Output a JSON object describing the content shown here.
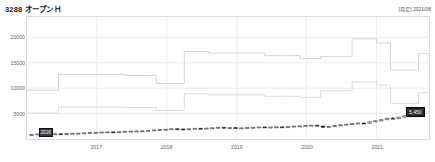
{
  "header": {
    "title": "3288 オープンＨ",
    "meta": "[月足] 2021/08"
  },
  "axes": {
    "y_ticks": [
      "20000",
      "15000",
      "10000",
      "5000"
    ],
    "x_ticks": [
      "2017",
      "2018",
      "2019",
      "2020",
      "2021"
    ]
  },
  "tags": {
    "last_price": "5,450",
    "cursor_date": "2016"
  },
  "colors": {
    "grid": "#ececec",
    "frame": "#dcdcdc",
    "line_upper": "#cfcfcf",
    "line_lower": "#d6d6d6",
    "candle_up": "#ffffff",
    "candle_down": "#1a1a1a",
    "candle_edge": "#222222",
    "tag_bg": "#2b2b2b",
    "text": "#333333"
  },
  "chart_data": {
    "type": "line",
    "title": "3288 オープンＨ",
    "subtitle": "[月足] 2021/08",
    "xlabel": "",
    "ylabel": "",
    "ylim": [
      0,
      24000
    ],
    "xlim": [
      2016.0,
      2021.75
    ],
    "grid": true,
    "legend": "none",
    "y_tick_values": [
      20000,
      15000,
      10000,
      5000
    ],
    "x_tick_values": [
      2017,
      2018,
      2019,
      2020,
      2021
    ],
    "series": [
      {
        "name": "upper-step-line",
        "type": "step",
        "color": "#cfcfcf",
        "x": [
          2016.0,
          2016.3,
          2016.45,
          2016.6,
          2017.0,
          2017.4,
          2017.7,
          2017.85,
          2018.0,
          2018.25,
          2018.45,
          2018.6,
          2019.0,
          2019.4,
          2019.7,
          2019.9,
          2020.0,
          2020.2,
          2020.45,
          2020.65,
          2020.85,
          2021.0,
          2021.2,
          2021.4,
          2021.6,
          2021.75
        ],
        "values": [
          9600,
          9600,
          12700,
          12700,
          12700,
          12500,
          12500,
          10900,
          10900,
          17200,
          17200,
          16900,
          16900,
          16400,
          16400,
          15800,
          15800,
          16200,
          16200,
          19700,
          19700,
          18900,
          13600,
          13600,
          16800,
          16100
        ]
      },
      {
        "name": "lower-step-line",
        "type": "step",
        "color": "#d6d6d6",
        "x": [
          2016.0,
          2016.3,
          2016.45,
          2016.6,
          2017.0,
          2017.4,
          2017.7,
          2017.85,
          2018.0,
          2018.25,
          2018.45,
          2018.6,
          2019.0,
          2019.4,
          2019.7,
          2019.9,
          2020.0,
          2020.2,
          2020.45,
          2020.65,
          2020.85,
          2021.0,
          2021.2,
          2021.4,
          2021.6,
          2021.75
        ],
        "values": [
          5100,
          5100,
          6300,
          6300,
          6300,
          6200,
          6200,
          5600,
          5600,
          8900,
          8900,
          8700,
          8700,
          8400,
          8400,
          8200,
          8200,
          9500,
          9500,
          11200,
          11200,
          10600,
          7000,
          7000,
          9100,
          8900
        ]
      },
      {
        "name": "candlestick-monthly",
        "type": "candlestick",
        "up_color": "#ffffff",
        "down_color": "#1a1a1a",
        "ohlc": [
          {
            "t": "2016-01",
            "o": 820,
            "h": 900,
            "l": 760,
            "c": 860
          },
          {
            "t": "2016-02",
            "o": 860,
            "h": 1010,
            "l": 830,
            "c": 980
          },
          {
            "t": "2016-03",
            "o": 980,
            "h": 1040,
            "l": 900,
            "c": 930
          },
          {
            "t": "2016-04",
            "o": 930,
            "h": 1000,
            "l": 890,
            "c": 960
          },
          {
            "t": "2016-05",
            "o": 960,
            "h": 1060,
            "l": 930,
            "c": 1030
          },
          {
            "t": "2016-06",
            "o": 1030,
            "h": 1080,
            "l": 950,
            "c": 990
          },
          {
            "t": "2016-07",
            "o": 990,
            "h": 1090,
            "l": 960,
            "c": 1060
          },
          {
            "t": "2016-08",
            "o": 1060,
            "h": 1140,
            "l": 1020,
            "c": 1110
          },
          {
            "t": "2016-09",
            "o": 1110,
            "h": 1180,
            "l": 1060,
            "c": 1130
          },
          {
            "t": "2016-10",
            "o": 1130,
            "h": 1230,
            "l": 1100,
            "c": 1200
          },
          {
            "t": "2016-11",
            "o": 1200,
            "h": 1290,
            "l": 1160,
            "c": 1260
          },
          {
            "t": "2016-12",
            "o": 1260,
            "h": 1340,
            "l": 1220,
            "c": 1300
          },
          {
            "t": "2017-01",
            "o": 1300,
            "h": 1390,
            "l": 1270,
            "c": 1360
          },
          {
            "t": "2017-02",
            "o": 1360,
            "h": 1430,
            "l": 1320,
            "c": 1400
          },
          {
            "t": "2017-03",
            "o": 1400,
            "h": 1470,
            "l": 1350,
            "c": 1380
          },
          {
            "t": "2017-04",
            "o": 1380,
            "h": 1460,
            "l": 1340,
            "c": 1430
          },
          {
            "t": "2017-05",
            "o": 1430,
            "h": 1520,
            "l": 1400,
            "c": 1490
          },
          {
            "t": "2017-06",
            "o": 1490,
            "h": 1580,
            "l": 1450,
            "c": 1540
          },
          {
            "t": "2017-07",
            "o": 1540,
            "h": 1620,
            "l": 1500,
            "c": 1580
          },
          {
            "t": "2017-08",
            "o": 1580,
            "h": 1660,
            "l": 1530,
            "c": 1610
          },
          {
            "t": "2017-09",
            "o": 1610,
            "h": 1720,
            "l": 1580,
            "c": 1690
          },
          {
            "t": "2017-10",
            "o": 1690,
            "h": 1810,
            "l": 1660,
            "c": 1780
          },
          {
            "t": "2017-11",
            "o": 1780,
            "h": 1900,
            "l": 1740,
            "c": 1860
          },
          {
            "t": "2017-12",
            "o": 1860,
            "h": 1960,
            "l": 1800,
            "c": 1900
          },
          {
            "t": "2018-01",
            "o": 1900,
            "h": 2050,
            "l": 1870,
            "c": 2010
          },
          {
            "t": "2018-02",
            "o": 2010,
            "h": 2090,
            "l": 1930,
            "c": 1970
          },
          {
            "t": "2018-03",
            "o": 1970,
            "h": 2060,
            "l": 1900,
            "c": 1930
          },
          {
            "t": "2018-04",
            "o": 1930,
            "h": 2040,
            "l": 1890,
            "c": 2000
          },
          {
            "t": "2018-05",
            "o": 2000,
            "h": 2130,
            "l": 1960,
            "c": 2090
          },
          {
            "t": "2018-06",
            "o": 2090,
            "h": 2180,
            "l": 2030,
            "c": 2060
          },
          {
            "t": "2018-07",
            "o": 2060,
            "h": 2170,
            "l": 2010,
            "c": 2130
          },
          {
            "t": "2018-08",
            "o": 2130,
            "h": 2240,
            "l": 2090,
            "c": 2200
          },
          {
            "t": "2018-09",
            "o": 2200,
            "h": 2330,
            "l": 2160,
            "c": 2290
          },
          {
            "t": "2018-10",
            "o": 2290,
            "h": 2360,
            "l": 2120,
            "c": 2180
          },
          {
            "t": "2018-11",
            "o": 2180,
            "h": 2280,
            "l": 2130,
            "c": 2240
          },
          {
            "t": "2018-12",
            "o": 2240,
            "h": 2310,
            "l": 2060,
            "c": 2110
          },
          {
            "t": "2019-01",
            "o": 2110,
            "h": 2230,
            "l": 2070,
            "c": 2190
          },
          {
            "t": "2019-02",
            "o": 2190,
            "h": 2290,
            "l": 2150,
            "c": 2250
          },
          {
            "t": "2019-03",
            "o": 2250,
            "h": 2340,
            "l": 2190,
            "c": 2280
          },
          {
            "t": "2019-04",
            "o": 2280,
            "h": 2400,
            "l": 2240,
            "c": 2360
          },
          {
            "t": "2019-05",
            "o": 2360,
            "h": 2420,
            "l": 2210,
            "c": 2260
          },
          {
            "t": "2019-06",
            "o": 2260,
            "h": 2370,
            "l": 2220,
            "c": 2330
          },
          {
            "t": "2019-07",
            "o": 2330,
            "h": 2430,
            "l": 2290,
            "c": 2390
          },
          {
            "t": "2019-08",
            "o": 2390,
            "h": 2450,
            "l": 2280,
            "c": 2320
          },
          {
            "t": "2019-09",
            "o": 2320,
            "h": 2470,
            "l": 2290,
            "c": 2430
          },
          {
            "t": "2019-10",
            "o": 2430,
            "h": 2560,
            "l": 2390,
            "c": 2520
          },
          {
            "t": "2019-11",
            "o": 2520,
            "h": 2620,
            "l": 2470,
            "c": 2580
          },
          {
            "t": "2019-12",
            "o": 2580,
            "h": 2700,
            "l": 2540,
            "c": 2660
          },
          {
            "t": "2020-01",
            "o": 2660,
            "h": 2760,
            "l": 2600,
            "c": 2700
          },
          {
            "t": "2020-02",
            "o": 2700,
            "h": 2780,
            "l": 2480,
            "c": 2540
          },
          {
            "t": "2020-03",
            "o": 2540,
            "h": 2620,
            "l": 2200,
            "c": 2300
          },
          {
            "t": "2020-04",
            "o": 2300,
            "h": 2520,
            "l": 2260,
            "c": 2470
          },
          {
            "t": "2020-05",
            "o": 2470,
            "h": 2680,
            "l": 2430,
            "c": 2640
          },
          {
            "t": "2020-06",
            "o": 2640,
            "h": 2830,
            "l": 2590,
            "c": 2780
          },
          {
            "t": "2020-07",
            "o": 2780,
            "h": 2950,
            "l": 2730,
            "c": 2900
          },
          {
            "t": "2020-08",
            "o": 2900,
            "h": 3080,
            "l": 2850,
            "c": 3030
          },
          {
            "t": "2020-09",
            "o": 3030,
            "h": 3200,
            "l": 2960,
            "c": 3130
          },
          {
            "t": "2020-10",
            "o": 3130,
            "h": 3280,
            "l": 3040,
            "c": 3100
          },
          {
            "t": "2020-11",
            "o": 3100,
            "h": 3420,
            "l": 3060,
            "c": 3380
          },
          {
            "t": "2020-12",
            "o": 3380,
            "h": 3620,
            "l": 3330,
            "c": 3570
          },
          {
            "t": "2021-01",
            "o": 3570,
            "h": 3860,
            "l": 3520,
            "c": 3800
          },
          {
            "t": "2021-02",
            "o": 3800,
            "h": 4150,
            "l": 3740,
            "c": 4080
          },
          {
            "t": "2021-03",
            "o": 4080,
            "h": 4320,
            "l": 3960,
            "c": 4010
          },
          {
            "t": "2021-04",
            "o": 4010,
            "h": 4360,
            "l": 3960,
            "c": 4290
          },
          {
            "t": "2021-05",
            "o": 4290,
            "h": 4620,
            "l": 4230,
            "c": 4560
          },
          {
            "t": "2021-06",
            "o": 4560,
            "h": 4880,
            "l": 4490,
            "c": 4820
          },
          {
            "t": "2021-07",
            "o": 4820,
            "h": 5260,
            "l": 4760,
            "c": 5180
          },
          {
            "t": "2021-08",
            "o": 5180,
            "h": 5620,
            "l": 5100,
            "c": 5450
          }
        ]
      }
    ]
  }
}
